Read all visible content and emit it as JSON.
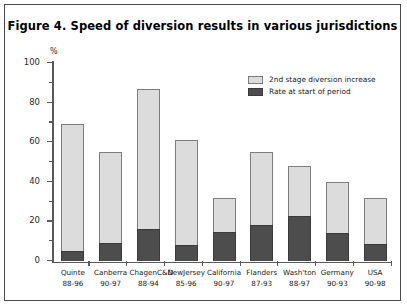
{
  "figure": {
    "title": "Figure 4. Speed of diversion results in various jurisdictions",
    "unit_label": "%"
  },
  "legend": {
    "position": "top-right",
    "items": [
      {
        "label": "2nd stage diversion increase",
        "color": "#dcdcdc",
        "swatch": "light-swatch"
      },
      {
        "label": "Rate at start of period",
        "color": "#4d4d4d",
        "swatch": "dark-swatch"
      }
    ]
  },
  "axis": {
    "y_ticks": [
      "0",
      "20",
      "40",
      "60",
      "80",
      "100"
    ],
    "y_min": 0,
    "y_max": 100
  },
  "categories": [
    {
      "name": "Quinte",
      "years": "88-96"
    },
    {
      "name": "Canberra",
      "years": "90-97"
    },
    {
      "name": "ChagenC&D",
      "years": "88-94"
    },
    {
      "name": "NewJersey",
      "years": "85-96"
    },
    {
      "name": "California",
      "years": "90-97"
    },
    {
      "name": "Flanders",
      "years": "87-93"
    },
    {
      "name": "Wash'ton",
      "years": "88-97"
    },
    {
      "name": "Germany",
      "years": "90-93"
    },
    {
      "name": "USA",
      "years": "90-98"
    }
  ],
  "chart_data": {
    "type": "bar",
    "stacked": true,
    "title": "Figure 4. Speed of diversion results in various jurisdictions",
    "xlabel": "",
    "ylabel": "%",
    "ylim": [
      0,
      100
    ],
    "yticks": [
      0,
      20,
      40,
      60,
      80,
      100
    ],
    "grid": false,
    "legend_position": "top-right",
    "categories": [
      "Quinte 88-96",
      "Canberra 90-97",
      "ChagenC&D 88-94",
      "NewJersey 85-96",
      "California 90-97",
      "Flanders 87-93",
      "Wash'ton 88-97",
      "Germany 90-93",
      "USA 90-98"
    ],
    "series": [
      {
        "name": "Rate at start of period",
        "color": "#4d4d4d",
        "values": [
          5,
          9,
          16,
          8,
          14.5,
          18,
          22.5,
          14,
          8.5
        ]
      },
      {
        "name": "2nd stage diversion increase",
        "color": "#dcdcdc",
        "values": [
          64,
          46,
          71,
          53,
          17.5,
          37,
          25.5,
          26,
          23.5
        ]
      }
    ],
    "totals": [
      69,
      55,
      87,
      61,
      32,
      55,
      48,
      40,
      32
    ]
  }
}
